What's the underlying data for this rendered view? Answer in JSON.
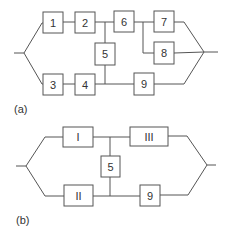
{
  "diagrams": [
    {
      "caption": "(a)",
      "blocks": [
        {
          "id": "1",
          "label": "1"
        },
        {
          "id": "2",
          "label": "2"
        },
        {
          "id": "3",
          "label": "3"
        },
        {
          "id": "4",
          "label": "4"
        },
        {
          "id": "5",
          "label": "5"
        },
        {
          "id": "6",
          "label": "6"
        },
        {
          "id": "7",
          "label": "7"
        },
        {
          "id": "8",
          "label": "8"
        },
        {
          "id": "9",
          "label": "9"
        }
      ],
      "connections": [
        [
          "input",
          "1"
        ],
        [
          "input",
          "3"
        ],
        [
          "1",
          "2"
        ],
        [
          "2",
          "6"
        ],
        [
          "2",
          "5"
        ],
        [
          "3",
          "4"
        ],
        [
          "4",
          "5"
        ],
        [
          "4",
          "9"
        ],
        [
          "6",
          "7"
        ],
        [
          "6",
          "8"
        ],
        [
          "7",
          "output"
        ],
        [
          "8",
          "output"
        ],
        [
          "9",
          "output"
        ]
      ]
    },
    {
      "caption": "(b)",
      "blocks": [
        {
          "id": "I",
          "label": "I"
        },
        {
          "id": "II",
          "label": "II"
        },
        {
          "id": "III",
          "label": "III"
        },
        {
          "id": "5",
          "label": "5"
        },
        {
          "id": "9",
          "label": "9"
        }
      ],
      "connections": [
        [
          "input",
          "I"
        ],
        [
          "input",
          "II"
        ],
        [
          "I",
          "III"
        ],
        [
          "I",
          "5"
        ],
        [
          "II",
          "5"
        ],
        [
          "II",
          "9"
        ],
        [
          "III",
          "output"
        ],
        [
          "9",
          "output"
        ]
      ]
    }
  ]
}
